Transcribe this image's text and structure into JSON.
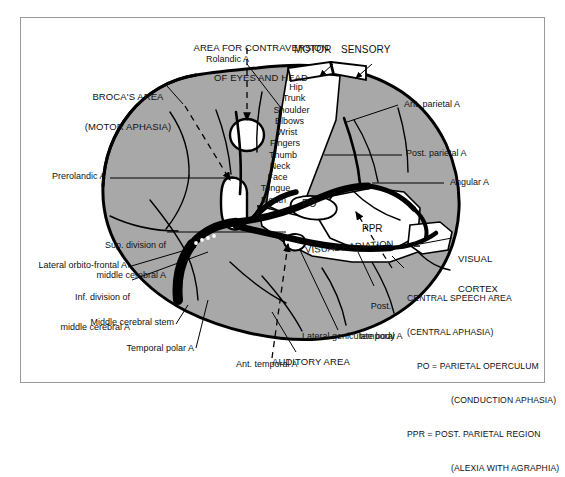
{
  "figure": {
    "kind": "anatomical-diagram",
    "colors": {
      "cortex_fill": "#a8a8a8",
      "outline": "#000000",
      "artery": "#000000",
      "page_background": "#ffffff",
      "frame_border": "#9a9a9a"
    }
  },
  "title_labels": {
    "contraversion": "AREA FOR CONTRAVERSION\nOF EYES AND HEAD",
    "contraversion_line1": "AREA FOR CONTRAVERSION",
    "contraversion_line2": "OF EYES AND HEAD",
    "motor": "MOTOR",
    "sensory": "SENSORY"
  },
  "region_labels": {
    "brocas_line1": "BROCA'S AREA",
    "brocas_line2": "(MOTOR APHASIA)",
    "po": "PO",
    "ppr": "PPR",
    "visual_radiation": "VISUAL RADIATION",
    "visual_cortex_line1": "VISUAL",
    "visual_cortex_line2": "CORTEX",
    "auditory_area": "AUDITORY AREA",
    "lateral_geniculate_body": "Lateral geniculate body"
  },
  "homunculus": {
    "caption": "Motor-sensory homunculus sequence",
    "parts": [
      "Hip",
      "Trunk",
      "Shoulder",
      "Elbows",
      "Wrist",
      "Fingers",
      "Thumb",
      "Neck",
      "Face",
      "Tongue",
      "Mouth"
    ]
  },
  "artery_labels": {
    "rolandic": "Rolandic A",
    "prerolandic": "Prerolandic A",
    "ant_parietal": "Ant. parietal A",
    "post_parietal": "Post. parietal A",
    "angular": "Angular A",
    "sup_division_l1": "Sup. division of",
    "sup_division_l2": "middle cerebral A",
    "lateral_orbito_frontal": "Lateral orbito-frontal A",
    "inf_division_l1": "Inf. division of",
    "inf_division_l2": "middle cerebral A",
    "middle_cerebral_stem": "Middle cerebral stem",
    "temporal_polar": "Temporal polar A",
    "ant_temporal": "Ant. temporal A",
    "post_temporal_l1": "Post.",
    "post_temporal_l2": "temporal A"
  },
  "legend": {
    "line1": "CENTRAL SPEECH AREA",
    "line2": "(CENTRAL APHASIA)",
    "line3": "PO = PARIETAL OPERCULUM",
    "line4": "(CONDUCTION APHASIA)",
    "line5": "PPR = POST. PARIETAL REGION",
    "line6": "(ALEXIA WITH AGRAPHIA)"
  }
}
